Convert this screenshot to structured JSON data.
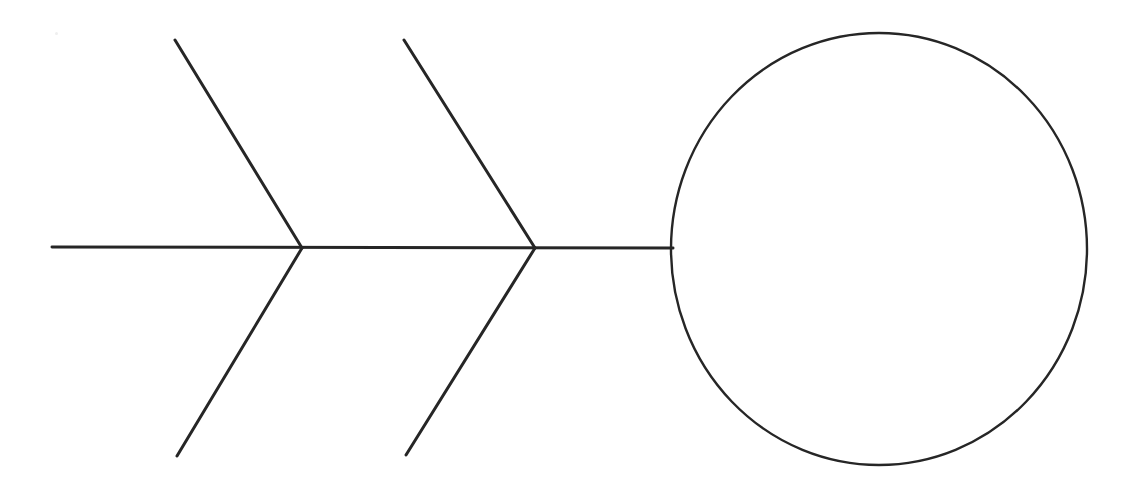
{
  "canvas": {
    "width": 1146,
    "height": 481,
    "background": "#ffffff"
  },
  "diagram": {
    "type": "fishbone-ishikawa-skeleton",
    "title": "",
    "stroke_color": "#262626",
    "spine_stroke_width": 3,
    "bone_stroke_width": 3,
    "head_stroke_width": 2.4,
    "head_fill": "none",
    "labels": []
  },
  "chart_data": {
    "type": "diagram",
    "title": "",
    "xlabel": "",
    "ylabel": "",
    "elements": {
      "spine": {
        "name": "spine",
        "x1": 52,
        "y1": 247,
        "x2": 673,
        "y2": 248,
        "label": ""
      },
      "head": {
        "name": "effect-head-circle",
        "cx": 879,
        "cy": 249,
        "rx": 208,
        "ry": 216,
        "label": ""
      },
      "bones": [
        {
          "name": "bone-upper-left",
          "x1": 175,
          "y1": 40,
          "x2": 302,
          "y2": 248,
          "side": "upper",
          "label": ""
        },
        {
          "name": "bone-upper-right",
          "x1": 404,
          "y1": 40,
          "x2": 535,
          "y2": 248,
          "side": "upper",
          "label": ""
        },
        {
          "name": "bone-lower-left",
          "x1": 177,
          "y1": 456,
          "x2": 302,
          "y2": 248,
          "side": "lower",
          "label": ""
        },
        {
          "name": "bone-lower-right",
          "x1": 406,
          "y1": 455,
          "x2": 535,
          "y2": 248,
          "side": "lower",
          "label": ""
        }
      ],
      "junctions": [
        {
          "name": "junction-left",
          "x": 302,
          "y": 248
        },
        {
          "name": "junction-right",
          "x": 535,
          "y": 248
        }
      ],
      "artifacts": [
        {
          "name": "scan-speck",
          "x": 55,
          "y": 32
        }
      ]
    }
  }
}
